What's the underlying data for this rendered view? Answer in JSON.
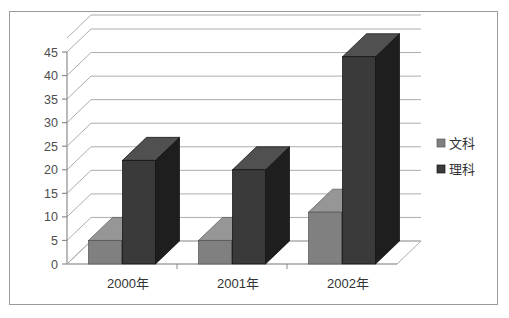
{
  "chart_data": {
    "type": "bar",
    "title": "",
    "subtitle": "",
    "xlabel": "",
    "ylabel": "",
    "categories": [
      "2000年",
      "2001年",
      "2002年"
    ],
    "series": [
      {
        "name": "文科",
        "values": [
          5,
          5,
          11
        ],
        "color": "#808080"
      },
      {
        "name": "理科",
        "values": [
          22,
          20,
          44
        ],
        "color": "#3a3a3a"
      }
    ],
    "ylim": [
      0,
      45
    ],
    "ytick_values": [
      0,
      5,
      10,
      15,
      20,
      25,
      30,
      35,
      40,
      45
    ],
    "ytick_labels": [
      "0",
      "5",
      "10",
      "15",
      "20",
      "25",
      "30",
      "35",
      "40",
      "45"
    ],
    "grid": true,
    "grid_axis": "y",
    "legend": {
      "position": "right",
      "entries": [
        {
          "label": "文科",
          "marker": "square",
          "color": "#808080"
        },
        {
          "label": "理科",
          "marker": "square",
          "color": "#3a3a3a"
        }
      ]
    },
    "style": {
      "three_d": true,
      "border_color": "#9a9a9a",
      "gridline_color": "#adadad",
      "axis_color": "#8c8c8c",
      "background": "#ffffff",
      "bar_top_color_light": "#9b9b9b",
      "bar_side_color_light": "#6a6a6a",
      "bar_top_color_dark": "#4a4a4a",
      "bar_side_color_dark": "#272727"
    }
  }
}
